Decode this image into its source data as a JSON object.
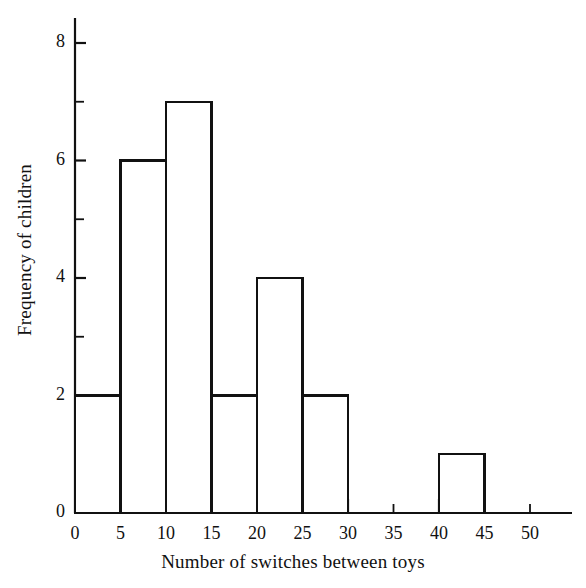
{
  "chart_data": {
    "type": "bar",
    "title": "",
    "subtitle": "",
    "xlabel": "Number of switches between toys",
    "ylabel": "Frequency of children",
    "bin_width": 5,
    "bin_edges": [
      0,
      5,
      10,
      15,
      20,
      25,
      30,
      35,
      40,
      45,
      50
    ],
    "categories": [
      "0-5",
      "5-10",
      "10-15",
      "15-20",
      "20-25",
      "25-30",
      "30-35",
      "35-40",
      "40-45",
      "45-50"
    ],
    "values": [
      2,
      6,
      7,
      2,
      4,
      2,
      0,
      0,
      1,
      0
    ],
    "bars": [
      {
        "start": 0,
        "end": 5,
        "value": 2
      },
      {
        "start": 5,
        "end": 10,
        "value": 6
      },
      {
        "start": 10,
        "end": 15,
        "value": 7
      },
      {
        "start": 15,
        "end": 20,
        "value": 2
      },
      {
        "start": 20,
        "end": 25,
        "value": 4
      },
      {
        "start": 25,
        "end": 30,
        "value": 2
      },
      {
        "start": 30,
        "end": 35,
        "value": 0
      },
      {
        "start": 35,
        "end": 40,
        "value": 0
      },
      {
        "start": 40,
        "end": 45,
        "value": 1
      },
      {
        "start": 45,
        "end": 50,
        "value": 0
      }
    ],
    "xlim": [
      0,
      54
    ],
    "ylim": [
      0,
      8.6
    ],
    "xticks": [
      0,
      5,
      10,
      15,
      20,
      25,
      30,
      35,
      40,
      45,
      50
    ],
    "xtick_labels": [
      "0",
      "5",
      "10",
      "15",
      "20",
      "25",
      "30",
      "35",
      "40",
      "45",
      "50"
    ],
    "yticks_major": [
      0,
      2,
      4,
      6,
      8
    ],
    "ytick_major_labels": [
      "0",
      "2",
      "4",
      "6",
      "8"
    ],
    "yticks_minor": [
      1,
      3,
      5,
      7
    ],
    "grid": false,
    "legend": null,
    "bar_fill": "#ffffff",
    "bar_edge": "#111111",
    "axis_color": "#111111",
    "background": "#ffffff"
  },
  "axes": {
    "x_title": "Number of switches between toys",
    "y_title": "Frequency of children"
  },
  "x_labels": [
    "0",
    "5",
    "10",
    "15",
    "20",
    "25",
    "30",
    "35",
    "40",
    "45",
    "50"
  ],
  "y_labels": [
    "0",
    "2",
    "4",
    "6",
    "8"
  ]
}
